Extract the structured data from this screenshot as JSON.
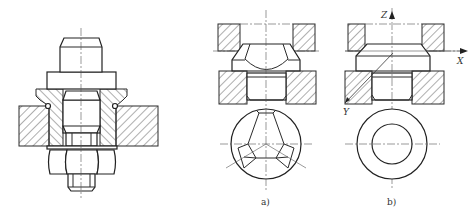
{
  "figure": {
    "type": "engineering-drawing",
    "panels": [
      {
        "id": "left",
        "name": "bolt-bushing-assembly",
        "caption": ""
      },
      {
        "id": "a",
        "name": "spherical-seat-view",
        "caption": "a)"
      },
      {
        "id": "b",
        "name": "conical-seat-view",
        "caption": "b)"
      }
    ],
    "axes": {
      "z_label": "Z",
      "x_label": "X",
      "y_label": "Y"
    }
  }
}
